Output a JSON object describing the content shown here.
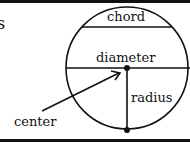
{
  "diagram": {
    "type": "circle-parts",
    "labels": {
      "partial_left": "s",
      "chord": "chord",
      "diameter": "diameter",
      "radius": "radius",
      "center": "center"
    },
    "colors": {
      "stroke": "#111111",
      "background": "#ffffff"
    }
  }
}
